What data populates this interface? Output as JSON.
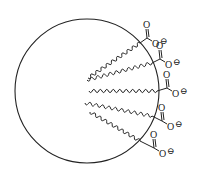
{
  "diagram": {
    "title": "",
    "stroke_color": "#222222",
    "background": "#ffffff",
    "micelle": {
      "cx": 87,
      "cy": 91,
      "r": 72
    },
    "chains": [
      {
        "x1": 88,
        "y1": 78,
        "x2": 140,
        "y2": 43,
        "head": {
          "cx": 150,
          "cy": 30,
          "o_top": "O",
          "o_minus": "O",
          "charge": "⊖"
        }
      },
      {
        "x1": 87,
        "y1": 80,
        "x2": 152,
        "y2": 63,
        "head": {
          "cx": 163,
          "cy": 51,
          "o_top": "O",
          "o_minus": "O",
          "charge": "⊖"
        }
      },
      {
        "x1": 89,
        "y1": 91,
        "x2": 157,
        "y2": 91,
        "head": {
          "cx": 170,
          "cy": 80,
          "o_top": "O",
          "o_minus": "O",
          "charge": "⊖"
        }
      },
      {
        "x1": 85,
        "y1": 103,
        "x2": 152,
        "y2": 116,
        "head": {
          "cx": 165,
          "cy": 113,
          "o_top": "O",
          "o_minus": "O",
          "charge": "⊖"
        }
      },
      {
        "x1": 90,
        "y1": 112,
        "x2": 140,
        "y2": 141,
        "head": {
          "cx": 157,
          "cy": 140,
          "o_top": "O",
          "o_minus": "O",
          "charge": "⊖"
        }
      }
    ],
    "labels": {
      "oxygen": "O",
      "negative_charge": "⊖"
    }
  }
}
